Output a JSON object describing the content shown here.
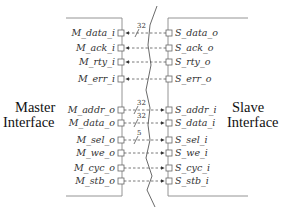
{
  "master": {
    "label_line1": "Master",
    "label_line2": "Interface",
    "ports": [
      {
        "name": "M_data_i",
        "y": 33,
        "dir": "in",
        "width": "32"
      },
      {
        "name": "M_ack_i",
        "y": 48,
        "dir": "in",
        "width": ""
      },
      {
        "name": "M_rty_i",
        "y": 62,
        "dir": "in",
        "width": ""
      },
      {
        "name": "M_err_i",
        "y": 79,
        "dir": "in",
        "width": ""
      },
      {
        "name": "M_addr_o",
        "y": 110,
        "dir": "out",
        "width": "32"
      },
      {
        "name": "M_data_o",
        "y": 123,
        "dir": "out",
        "width": "32"
      },
      {
        "name": "M_sel_o",
        "y": 140,
        "dir": "out",
        "width": "5"
      },
      {
        "name": "M_we_o",
        "y": 153,
        "dir": "out",
        "width": ""
      },
      {
        "name": "M_cyc_o",
        "y": 168,
        "dir": "out",
        "width": ""
      },
      {
        "name": "M_stb_o",
        "y": 181,
        "dir": "out",
        "width": ""
      }
    ]
  },
  "slave": {
    "label_line1": "Slave",
    "label_line2": "Interface",
    "ports": [
      {
        "name": "S_data_o",
        "y": 33
      },
      {
        "name": "S_ack_o",
        "y": 48
      },
      {
        "name": "S_rty_o",
        "y": 62
      },
      {
        "name": "S_err_o",
        "y": 79
      },
      {
        "name": "S_addr_i",
        "y": 110
      },
      {
        "name": "S_data_i",
        "y": 123
      },
      {
        "name": "S_sel_i",
        "y": 140
      },
      {
        "name": "S_we_i",
        "y": 153
      },
      {
        "name": "S_cyc_i",
        "y": 168
      },
      {
        "name": "S_stb_i",
        "y": 181
      }
    ]
  },
  "labels": {
    "m_data_i": "M_data_i",
    "m_ack_i": "M_ack_i",
    "m_rty_i": "M_rty_i",
    "m_err_i": "M_err_i",
    "m_addr_o": "M_addr_o",
    "m_data_o": "M_data_o",
    "m_sel_o": "M_sel_o",
    "m_we_o": "M_we_o",
    "m_cyc_o": "M_cyc_o",
    "m_stb_o": "M_stb_o",
    "s_data_o": "S_data_o",
    "s_ack_o": "S_ack_o",
    "s_rty_o": "S_rty_o",
    "s_err_o": "S_err_o",
    "s_addr_i": "S_addr_i",
    "s_data_i": "S_data_i",
    "s_sel_i": "S_sel_i",
    "s_we_i": "S_we_i",
    "s_cyc_i": "S_cyc_i",
    "s_stb_i": "S_stb_i",
    "w_data_i": "32",
    "w_addr_o": "32",
    "w_data_o": "32",
    "w_sel_o": "5"
  },
  "colors": {
    "line": "#555555",
    "text": "#333333"
  }
}
